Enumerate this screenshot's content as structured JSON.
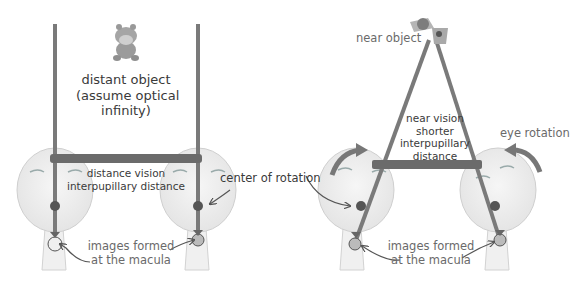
{
  "left_panel": {
    "distant_object": {
      "icon": "toy-hippo-icon",
      "lines": [
        "distant object",
        "(assume optical",
        "infinity)"
      ]
    },
    "ipd_label": [
      "distance vision",
      "interpupillary distance"
    ],
    "center_label": "center of rotation",
    "macula_label": [
      "images formed",
      "at the macula"
    ]
  },
  "right_panel": {
    "near_object": {
      "icon": "near-object-toy-icon",
      "label": "near object"
    },
    "ipd_label": [
      "near vision",
      "shorter",
      "interpupillary",
      "distance"
    ],
    "rotation_label": "eye rotation",
    "macula_label": [
      "images formed",
      "at the macula"
    ]
  },
  "colors": {
    "sight_line": "#7a7a7a",
    "ipd_bar": "#6b6b6b",
    "eye_fill": "#eeeeee",
    "eye_stroke": "#c8c8c8",
    "arrow": "#6e6e6e",
    "text": "#3a3a3a"
  }
}
